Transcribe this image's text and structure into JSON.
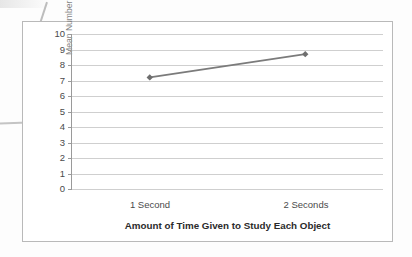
{
  "chart_data": {
    "type": "line",
    "title": "",
    "xlabel": "Amount of Time Given to Study Each Object",
    "ylabel": "Mean Number of Objects Retained",
    "categories": [
      "1 Second",
      "2 Seconds"
    ],
    "values": [
      7.2,
      8.7
    ],
    "series": [
      {
        "name": "Mean Number of Objects Retained",
        "values": [
          7.2,
          8.7
        ]
      }
    ],
    "ylim": [
      0,
      10
    ],
    "ytick_labels": [
      "10",
      "9",
      "8",
      "7",
      "6",
      "5",
      "4",
      "3",
      "2",
      "1",
      "0"
    ],
    "ytick_values": [
      10,
      9,
      8,
      7,
      6,
      5,
      4,
      3,
      2,
      1,
      0
    ],
    "grid": true,
    "grid_orientation": "horizontal",
    "legend": false,
    "legend_position": "none",
    "marker": "diamond",
    "line_color": "#7b7b7b",
    "marker_color": "#6e6e6e",
    "gridline_color": "#cfcfcf",
    "axis_color": "#9a9a9a",
    "border_color": "#b9b9b9"
  },
  "figure": {
    "background_color": "#fdfdfd",
    "plot_background_color": "#ffffff",
    "artifacts": [
      "diagonal-scan-line",
      "bent-scan-line",
      "edge-smudge"
    ]
  }
}
